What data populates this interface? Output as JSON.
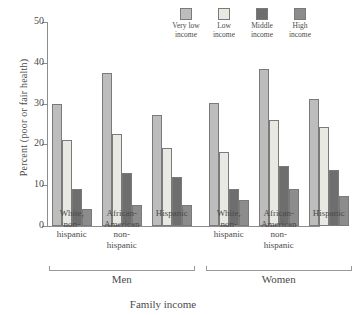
{
  "chart_data": {
    "type": "bar",
    "title": "",
    "xlabel": "Family income",
    "ylabel": "Percent (poor or fair health)",
    "ylim": [
      0,
      50
    ],
    "yticks": [
      0,
      10,
      20,
      30,
      40,
      50
    ],
    "grid": false,
    "legend_position": "top-right",
    "categories": [
      "White, non-hispanic",
      "African-American non-hispanic",
      "Hispanic",
      "White, non-hispanic",
      "African-American non-hispanic",
      "Hispanic"
    ],
    "category_lines": [
      [
        "White,",
        "non-",
        "hispanic"
      ],
      [
        "African-",
        "American",
        "non-",
        "hispanic"
      ],
      [
        "Hispanic"
      ],
      [
        "White,",
        "non-",
        "hispanic"
      ],
      [
        "African-",
        "American",
        "non-",
        "hispanic"
      ],
      [
        "Hispanic"
      ]
    ],
    "supergroups": [
      {
        "label": "Men",
        "categories": [
          0,
          1,
          2
        ]
      },
      {
        "label": "Women",
        "categories": [
          3,
          4,
          5
        ]
      }
    ],
    "series": [
      {
        "name": "Very low income",
        "color": "#bdbdbd",
        "values": [
          30.0,
          37.5,
          27.2,
          30.1,
          38.6,
          31.2
        ]
      },
      {
        "name": "Low income",
        "color": "#e9e9e4",
        "values": [
          21.0,
          22.6,
          19.1,
          18.2,
          26.1,
          24.3
        ]
      },
      {
        "name": "Middle income",
        "color": "#6e6e6e",
        "values": [
          9.0,
          13.0,
          12.1,
          9.1,
          14.7,
          13.8
        ]
      },
      {
        "name": "High income",
        "color": "#8c8c8c",
        "values": [
          4.2,
          5.2,
          5.2,
          6.3,
          9.1,
          7.3
        ]
      }
    ]
  },
  "legend": {
    "items": [
      {
        "line1": "Very low",
        "line2": "income"
      },
      {
        "line1": "Low",
        "line2": "income"
      },
      {
        "line1": "Middle",
        "line2": "income"
      },
      {
        "line1": "High",
        "line2": "income"
      }
    ]
  }
}
